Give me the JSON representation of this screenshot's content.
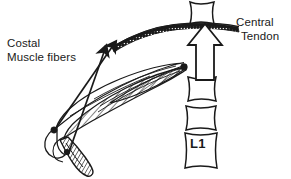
{
  "figure": {
    "background_color": "#ffffff",
    "ink_color": "#1a1a1a",
    "labels": {
      "costal": {
        "line1": "Costal",
        "line2": "Muscle fibers"
      },
      "central": {
        "line1": "Central",
        "line2": "Tendon"
      },
      "vertebra": "L1"
    },
    "annotations": {
      "dome_band_name": "central-tendon-dome",
      "arrow_name": "vertical-hollow-arrow",
      "muscle_name": "costal-muscle-fibers",
      "rib_name": "rib-costal-margin",
      "spine_name": "lumbar-vertebral-column"
    }
  }
}
